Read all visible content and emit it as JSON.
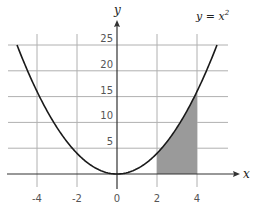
{
  "chart_data": {
    "type": "line",
    "title": "",
    "function": "y = x^2",
    "curve_label": "y = x",
    "curve_label_exponent": "2",
    "xlabel": "x",
    "ylabel": "y",
    "xlim": [
      -5.5,
      6
    ],
    "ylim": [
      0,
      30
    ],
    "x_ticks": [
      -4,
      -2,
      0,
      2,
      4
    ],
    "x_tick_labels": [
      "-4",
      "-2",
      "0",
      "2",
      "4"
    ],
    "y_ticks": [
      5,
      10,
      15,
      20,
      25
    ],
    "y_tick_labels": [
      "5",
      "10",
      "15",
      "20",
      "25"
    ],
    "grid": true,
    "shaded_region": {
      "from_x": 2,
      "to_x": 4,
      "description": "area under y = x^2 from x = 2 to x = 4"
    },
    "curve_domain": [
      -5,
      5
    ],
    "series": [
      {
        "name": "y = x^2",
        "x": [
          -5,
          -4,
          -3,
          -2,
          -1,
          0,
          1,
          2,
          3,
          4,
          5
        ],
        "y": [
          25,
          16,
          9,
          4,
          1,
          0,
          1,
          4,
          9,
          16,
          25
        ]
      }
    ],
    "colors": {
      "curve": "#1a1a1a",
      "grid": "#b0b0b0",
      "shade": "#9a9a9a",
      "axis": "#333333"
    }
  }
}
